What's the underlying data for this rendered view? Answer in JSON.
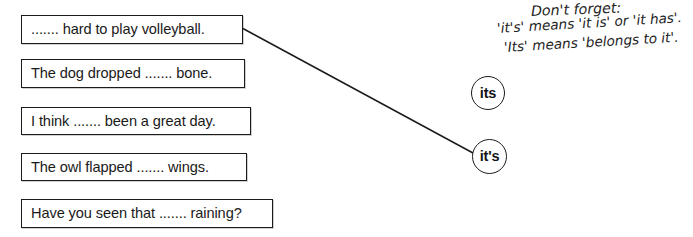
{
  "page": {
    "background_color": "#ffffff",
    "ink_color": "#1b1b1b"
  },
  "sentences": [
    {
      "id": "sentence-1",
      "text": "....... hard to play volleyball."
    },
    {
      "id": "sentence-2",
      "text": "The dog dropped ....... bone."
    },
    {
      "id": "sentence-3",
      "text": "I think ....... been a great day."
    },
    {
      "id": "sentence-4",
      "text": "The owl flapped ....... wings."
    },
    {
      "id": "sentence-5",
      "text": "Have you seen that ....... raining?"
    }
  ],
  "answer_options": [
    {
      "id": "option-its",
      "label": "its"
    },
    {
      "id": "option-its-s",
      "label": "it's"
    }
  ],
  "reminder_note": {
    "line_1": "Don't forget:",
    "line_2": "'it's' means 'it is' or 'it has'.",
    "line_3": "'Its' means 'belongs to it'."
  },
  "connector": {
    "from": "sentence-1",
    "to": "option-its-s",
    "x1": 242,
    "y1": 28,
    "x2": 473,
    "y2": 153,
    "color": "#1b1b1b",
    "stroke_width": 1.5
  }
}
